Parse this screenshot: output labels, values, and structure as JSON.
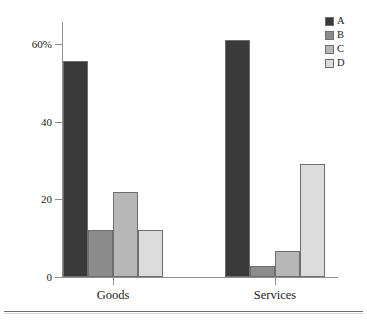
{
  "chart_data": {
    "type": "bar",
    "title": "",
    "subtitle": "",
    "xlabel": "",
    "ylabel": "",
    "categories": [
      "Goods",
      "Services"
    ],
    "series": [
      {
        "name": "A",
        "values": [
          55.6,
          61.0
        ],
        "color": "#3a3a3a"
      },
      {
        "name": "B",
        "values": [
          12.1,
          2.8
        ],
        "color": "#8c8c8c"
      },
      {
        "name": "C",
        "values": [
          21.9,
          6.7
        ],
        "color": "#b7b7b7"
      },
      {
        "name": "D",
        "values": [
          12.1,
          29.1
        ],
        "color": "#dcdcdc"
      }
    ],
    "ylim": [
      0,
      65
    ],
    "yticks": [
      0,
      20,
      40,
      60
    ],
    "ytick_labels": [
      "0",
      "20",
      "40",
      "60%"
    ],
    "grid": false,
    "legend_position": "top-right",
    "legend_entries": [
      "A",
      "B",
      "C",
      "D"
    ]
  },
  "axes": {
    "y_ticks": [
      {
        "label": "60%",
        "value": 60
      },
      {
        "label": "40",
        "value": 40
      },
      {
        "label": "20",
        "value": 20
      },
      {
        "label": "0",
        "value": 0
      }
    ],
    "x_ticks": [
      {
        "label": "Goods"
      },
      {
        "label": "Services"
      }
    ]
  },
  "colors": {
    "series_a": "#3a3a3a",
    "series_b": "#8c8c8c",
    "series_c": "#b7b7b7",
    "series_d": "#dcdcdc",
    "axis": "#8f8f8f",
    "bar_outline": "#6e6e6e",
    "text": "#1a1a1a",
    "rule": "#6b6b6b",
    "background": "#ffffff"
  }
}
